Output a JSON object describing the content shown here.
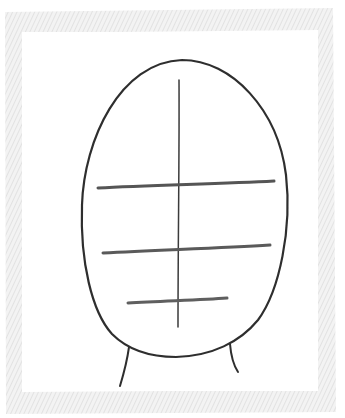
{
  "artwork": {
    "title": "Head proportion sketch",
    "medium": "pencil drawing",
    "colors": {
      "paper": "#ffffff",
      "frame_hatch": "#e6e6e6",
      "frame_hatch_dark": "#dcdcdc",
      "outline": "#2f2f2f",
      "guide_line": "#5a5a5a"
    },
    "frame": {
      "outer": {
        "x": 5,
        "y": 10,
        "width": 330,
        "height": 402
      },
      "inner": {
        "x": 22,
        "y": 33,
        "width": 296,
        "height": 357
      }
    },
    "head": {
      "top": [
        182,
        60
      ],
      "left_extreme": [
        82,
        205
      ],
      "right_extreme": [
        288,
        210
      ],
      "chin": [
        176,
        357
      ]
    },
    "guides": {
      "vertical_center": {
        "x1": 179,
        "y1": 80,
        "x2": 178,
        "y2": 327
      },
      "horizontal": [
        {
          "name": "brow-line",
          "x1": 98,
          "y1": 188,
          "x2": 274,
          "y2": 181
        },
        {
          "name": "nose-line",
          "x1": 103,
          "y1": 253,
          "x2": 270,
          "y2": 245
        },
        {
          "name": "mouth-line",
          "x1": 128,
          "y1": 303,
          "x2": 227,
          "y2": 298
        }
      ]
    },
    "neck": {
      "left": {
        "x1": 129,
        "y1": 347,
        "x2": 120,
        "y2": 386
      },
      "right": {
        "x1": 230,
        "y1": 344,
        "x2": 238,
        "y2": 372
      }
    }
  }
}
